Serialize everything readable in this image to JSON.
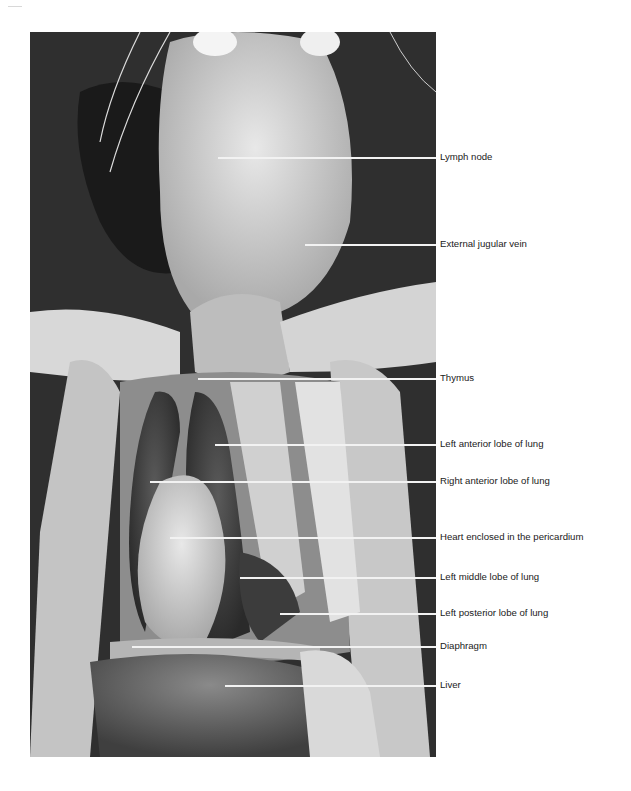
{
  "figure": {
    "labels": [
      {
        "text": "Lymph node",
        "y": 157,
        "line_start_x": 218
      },
      {
        "text": "External jugular vein",
        "y": 244,
        "line_start_x": 305
      },
      {
        "text": "Thymus",
        "y": 378,
        "line_start_x": 198
      },
      {
        "text": "Left anterior lobe of lung",
        "y": 444,
        "line_start_x": 215
      },
      {
        "text": "Right anterior lobe of lung",
        "y": 481,
        "line_start_x": 150
      },
      {
        "text": "Heart enclosed in the pericardium",
        "y": 537,
        "line_start_x": 170
      },
      {
        "text": "Left middle lobe of lung",
        "y": 577,
        "line_start_x": 240
      },
      {
        "text": "Left posterior lobe of lung",
        "y": 613,
        "line_start_x": 280
      },
      {
        "text": "Diaphragm",
        "y": 646,
        "line_start_x": 132
      },
      {
        "text": "Liver",
        "y": 685,
        "line_start_x": 225
      }
    ]
  }
}
